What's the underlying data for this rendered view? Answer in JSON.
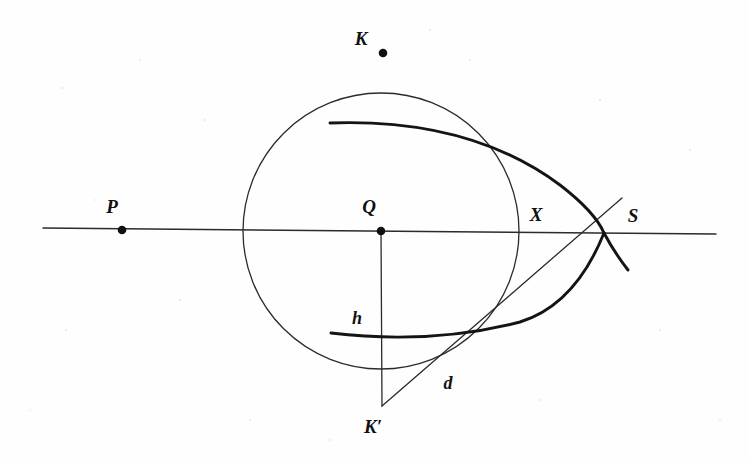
{
  "figure": {
    "kind": "geometry-diagram",
    "caption": "",
    "background_color": "#fefefe",
    "ink_color": "#1a1a1a",
    "labels": {
      "K": "K",
      "K_prime": "K′",
      "P": "P",
      "Q": "Q",
      "X": "X",
      "S": "S",
      "h": "h",
      "d": "d"
    },
    "points": [
      {
        "name": "K",
        "label": "K",
        "x": 383,
        "y": 53,
        "dot": true,
        "label_x": 361,
        "label_y": 45
      },
      {
        "name": "P",
        "label": "P",
        "x": 122,
        "y": 230,
        "dot": true,
        "label_x": 112,
        "label_y": 213
      },
      {
        "name": "Q",
        "label": "Q",
        "x": 381,
        "y": 231,
        "dot": true,
        "label_x": 369,
        "label_y": 213
      },
      {
        "name": "X",
        "label": "X",
        "x": 519,
        "y": 232,
        "dot": false,
        "label_x": 528,
        "label_y": 221
      },
      {
        "name": "S",
        "label": "S",
        "x": 604,
        "y": 233,
        "dot": false,
        "label_x": 626,
        "label_y": 222
      },
      {
        "name": "Kp",
        "label": "K′",
        "x": 382,
        "y": 406,
        "dot": false,
        "label_x": 363,
        "label_y": 433
      }
    ],
    "segment_labels": [
      {
        "name": "h",
        "label": "h",
        "label_x": 351,
        "label_y": 324
      },
      {
        "name": "d",
        "label": "d",
        "label_x": 441,
        "label_y": 389
      }
    ],
    "elements": [
      {
        "name": "horizontal-axis-line",
        "type": "line",
        "from": [
          43,
          228
        ],
        "to": [
          716,
          234
        ],
        "weight": "thin"
      },
      {
        "name": "circle-centre-Q",
        "type": "circle",
        "center": [
          381,
          231
        ],
        "radius": 138,
        "weight": "thin"
      },
      {
        "name": "vertical-segment-QK-prime",
        "type": "line",
        "from": [
          381,
          231
        ],
        "to": [
          382,
          406
        ],
        "weight": "thin"
      },
      {
        "name": "chord-line-K-prime-to-S",
        "type": "line",
        "from": [
          382,
          406
        ],
        "to": [
          622,
          198
        ],
        "weight": "thin"
      },
      {
        "name": "upper-thick-arc",
        "type": "arc",
        "weight": "thick",
        "path": "M 330 123 Q 470 118 560 185 Q 595 212 604 233 Q 614 252 628 270"
      },
      {
        "name": "lower-thick-arc",
        "type": "arc",
        "weight": "thick",
        "path": "M 331 333 Q 430 345 520 322 Q 575 305 604 233"
      }
    ],
    "stroke_widths": {
      "thin": 1.3,
      "thick": 2.9
    },
    "dot_radius": 4.2
  }
}
